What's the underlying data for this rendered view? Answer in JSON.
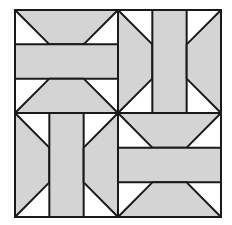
{
  "diagram": {
    "type": "quilt-block",
    "colors": {
      "fill": "#d4d4d4",
      "background": "#ffffff",
      "stroke": "#1a1a1a"
    },
    "block": {
      "x": 15,
      "y": 10,
      "width": 206,
      "height": 207,
      "center_x": 118,
      "center_y": 113
    },
    "quadrants": [
      {
        "position": "top-left",
        "orientation": "horizontal"
      },
      {
        "position": "top-right",
        "orientation": "vertical"
      },
      {
        "position": "bottom-left",
        "orientation": "vertical"
      },
      {
        "position": "bottom-right",
        "orientation": "horizontal"
      }
    ]
  }
}
